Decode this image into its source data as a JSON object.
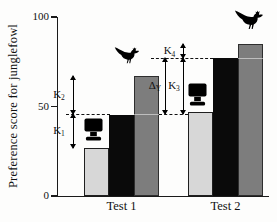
{
  "chart_data": {
    "type": "bar",
    "title": "",
    "ylabel": "Preference score for junglefowl",
    "xlabel": "",
    "categories": [
      "Test 1",
      "Test 2"
    ],
    "series": [
      {
        "name": "light-gray",
        "icon": "tv-monitor",
        "color": "#d7d7d7",
        "border": "#1f1f1f",
        "values": [
          27,
          47
        ]
      },
      {
        "name": "black",
        "icon": "",
        "color": "#0a0a0a",
        "border": "",
        "values": [
          45,
          77
        ]
      },
      {
        "name": "dark-gray",
        "icon": "junglefowl-bird",
        "color": "#7d7d7d",
        "border": "#2e2e2e",
        "values": [
          67,
          85
        ]
      }
    ],
    "ylim": [
      0,
      100
    ],
    "yticks": [
      0,
      50,
      100
    ],
    "grid": false,
    "legend": false,
    "dashed_reference_lines": [
      46,
      77
    ],
    "annotations": [
      {
        "id": "K1",
        "base": "K",
        "sub": "1",
        "from": 27,
        "to": 46,
        "group": "Test 1"
      },
      {
        "id": "K2",
        "base": "K",
        "sub": "2",
        "from": 46,
        "to": 67,
        "group": "Test 1"
      },
      {
        "id": "DY",
        "base": "Δ",
        "sub": "Y",
        "from": 46,
        "to": 77,
        "group": "Test 2"
      },
      {
        "id": "K3",
        "base": "K",
        "sub": "3",
        "from": 46,
        "to": 77,
        "group": "Test 2"
      },
      {
        "id": "K4",
        "base": "K",
        "sub": "4",
        "from": 77,
        "to": 85,
        "group": "Test 2"
      }
    ],
    "icons": [
      {
        "name": "tv-monitor-icon",
        "meaning": "video/monitor stimulus, shown above light-gray bars",
        "count": 2
      },
      {
        "name": "junglefowl-icon",
        "meaning": "live junglefowl, shown above dark-gray bars",
        "count": 2
      }
    ]
  }
}
